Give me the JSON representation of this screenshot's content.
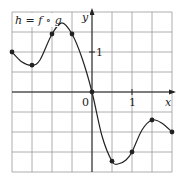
{
  "chart_data": {
    "type": "line",
    "title": "h = f ∘ g",
    "xlabel": "x",
    "ylabel": "y",
    "xlim": [
      -2,
      2
    ],
    "ylim": [
      -2,
      2
    ],
    "grid": true,
    "grid_step": 0.5,
    "x_tick_labels": [
      {
        "value": 0,
        "label": "0"
      },
      {
        "value": 1,
        "label": "1"
      }
    ],
    "y_tick_labels": [
      {
        "value": 1,
        "label": "1"
      }
    ],
    "series": [
      {
        "name": "h = f ∘ g",
        "marked_points": [
          {
            "x": -2.0,
            "y": 1.0
          },
          {
            "x": -1.5,
            "y": 0.67
          },
          {
            "x": -1.0,
            "y": 1.45
          },
          {
            "x": -0.5,
            "y": 1.45
          },
          {
            "x": 0.0,
            "y": 0.0
          },
          {
            "x": 0.5,
            "y": -1.73
          },
          {
            "x": 1.0,
            "y": -1.5
          },
          {
            "x": 1.5,
            "y": -0.7
          },
          {
            "x": 2.0,
            "y": -1.0
          }
        ],
        "curve_points": [
          {
            "x": -2.0,
            "y": 1.0
          },
          {
            "x": -1.75,
            "y": 0.75
          },
          {
            "x": -1.5,
            "y": 0.67
          },
          {
            "x": -1.3,
            "y": 0.8
          },
          {
            "x": -1.0,
            "y": 1.45
          },
          {
            "x": -0.75,
            "y": 1.73
          },
          {
            "x": -0.5,
            "y": 1.45
          },
          {
            "x": -0.25,
            "y": 0.85
          },
          {
            "x": 0.0,
            "y": 0.0
          },
          {
            "x": 0.25,
            "y": -1.1
          },
          {
            "x": 0.5,
            "y": -1.73
          },
          {
            "x": 0.65,
            "y": -1.8
          },
          {
            "x": 0.85,
            "y": -1.7
          },
          {
            "x": 1.0,
            "y": -1.5
          },
          {
            "x": 1.25,
            "y": -0.95
          },
          {
            "x": 1.5,
            "y": -0.7
          },
          {
            "x": 1.75,
            "y": -0.78
          },
          {
            "x": 2.0,
            "y": -1.0
          }
        ]
      }
    ]
  },
  "labels": {
    "function_name": "h = f ∘ g",
    "x_axis": "x",
    "y_axis": "y",
    "origin": "0",
    "x_one": "1",
    "y_one": "1"
  }
}
